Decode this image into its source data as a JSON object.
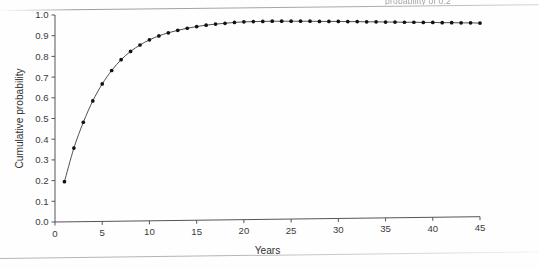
{
  "page": {
    "caption_fragment": "probability of 0.2",
    "rule_top_name": "page-edge-rule",
    "rule_bottom_name": "page-edge-rule"
  },
  "chart_data": {
    "type": "line",
    "title": "",
    "subtitle": "",
    "xlabel": "Years",
    "ylabel": "Cumulative probability",
    "xlim": [
      0,
      45
    ],
    "ylim": [
      0.0,
      1.0
    ],
    "xticks": [
      0,
      5,
      10,
      15,
      20,
      25,
      30,
      35,
      40,
      45
    ],
    "xtick_labels": [
      "0",
      "5",
      "10",
      "15",
      "20",
      "25",
      "30",
      "35",
      "40",
      "45"
    ],
    "yticks": [
      0.0,
      0.1,
      0.2,
      0.3,
      0.4,
      0.5,
      0.6,
      0.7,
      0.8,
      0.9,
      1.0
    ],
    "ytick_labels": [
      "0.0",
      "0.1",
      "0.2",
      "0.3",
      "0.4",
      "0.5",
      "0.6",
      "0.7",
      "0.8",
      "0.9",
      "1.0"
    ],
    "grid": false,
    "legend": null,
    "legend_position": "none",
    "marker": "filled-circle",
    "line_color": "#3c3c40",
    "marker_color": "#121214",
    "x": [
      1,
      2,
      3,
      4,
      5,
      6,
      7,
      8,
      9,
      10,
      11,
      12,
      13,
      14,
      15,
      16,
      17,
      18,
      19,
      20,
      21,
      22,
      23,
      24,
      25,
      26,
      27,
      28,
      29,
      30,
      31,
      32,
      33,
      34,
      35,
      36,
      37,
      38,
      39,
      40,
      41,
      42,
      43,
      44,
      45
    ],
    "y": [
      0.195,
      0.357,
      0.482,
      0.585,
      0.667,
      0.732,
      0.784,
      0.824,
      0.855,
      0.88,
      0.899,
      0.914,
      0.926,
      0.936,
      0.944,
      0.951,
      0.956,
      0.96,
      0.964,
      0.967,
      0.968,
      0.969,
      0.97,
      0.97,
      0.97,
      0.97,
      0.97,
      0.969,
      0.969,
      0.969,
      0.968,
      0.968,
      0.967,
      0.967,
      0.966,
      0.966,
      0.965,
      0.965,
      0.964,
      0.964,
      0.963,
      0.963,
      0.962,
      0.962,
      0.961
    ],
    "series": [
      {
        "name": "Cumulative probability",
        "values": [
          0.195,
          0.357,
          0.482,
          0.585,
          0.667,
          0.732,
          0.784,
          0.824,
          0.855,
          0.88,
          0.899,
          0.914,
          0.926,
          0.936,
          0.944,
          0.951,
          0.956,
          0.96,
          0.964,
          0.967,
          0.968,
          0.969,
          0.97,
          0.97,
          0.97,
          0.97,
          0.97,
          0.969,
          0.969,
          0.969,
          0.968,
          0.968,
          0.967,
          0.967,
          0.966,
          0.966,
          0.965,
          0.965,
          0.964,
          0.964,
          0.963,
          0.963,
          0.962,
          0.962,
          0.961
        ]
      }
    ]
  }
}
